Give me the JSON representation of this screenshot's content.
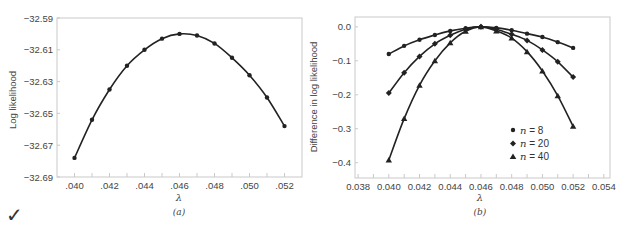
{
  "chart_data": [
    {
      "type": "line",
      "panel_label": "(a)",
      "title": "",
      "xlabel": "λ",
      "ylabel": "Log likelihood",
      "xlim": [
        0.039,
        0.053
      ],
      "ylim": [
        -32.69,
        -32.59
      ],
      "x_ticks": [
        ".040",
        ".042",
        ".044",
        ".046",
        ".048",
        ".050",
        ".052"
      ],
      "y_ticks": [
        "-32.59",
        "-32.61",
        "-32.63",
        "-32.65",
        "-32.67",
        "-32.69"
      ],
      "grid": false,
      "x": [
        0.04,
        0.041,
        0.042,
        0.043,
        0.044,
        0.045,
        0.046,
        0.047,
        0.048,
        0.049,
        0.05,
        0.051,
        0.052
      ],
      "series": [
        {
          "name": "Log likelihood",
          "marker": "circle",
          "values": [
            -32.678,
            -32.654,
            -32.635,
            -32.62,
            -32.61,
            -32.603,
            -32.6,
            -32.601,
            -32.606,
            -32.615,
            -32.626,
            -32.64,
            -32.658
          ]
        }
      ]
    },
    {
      "type": "line",
      "panel_label": "(b)",
      "title": "",
      "xlabel": "λ",
      "ylabel": "Difference in log likelihood",
      "xlim": [
        0.038,
        0.054
      ],
      "ylim": [
        -0.445,
        0.02
      ],
      "x_ticks": [
        "0.038",
        "0.040",
        "0.042",
        "0.044",
        "0.046",
        "0.048",
        "0.050",
        "0.052",
        "0.054"
      ],
      "y_ticks": [
        "0.0",
        "-0.1",
        "-0.2",
        "-0.3",
        "-0.4"
      ],
      "grid": false,
      "legend_position": "lower right",
      "x": [
        0.04,
        0.041,
        0.042,
        0.043,
        0.044,
        0.045,
        0.046,
        0.047,
        0.048,
        0.049,
        0.05,
        0.051,
        0.052
      ],
      "series": [
        {
          "name": "n = 8",
          "marker": "circle",
          "values": [
            -0.08,
            -0.056,
            -0.038,
            -0.024,
            -0.012,
            -0.004,
            0.0,
            -0.003,
            -0.01,
            -0.02,
            -0.03,
            -0.045,
            -0.062
          ]
        },
        {
          "name": "n = 20",
          "marker": "diamond",
          "values": [
            -0.195,
            -0.135,
            -0.087,
            -0.05,
            -0.025,
            -0.007,
            0.0,
            -0.007,
            -0.022,
            -0.04,
            -0.068,
            -0.103,
            -0.148
          ]
        },
        {
          "name": "n = 40",
          "marker": "triangle",
          "values": [
            -0.392,
            -0.27,
            -0.172,
            -0.1,
            -0.047,
            -0.013,
            0.0,
            -0.012,
            -0.033,
            -0.073,
            -0.13,
            -0.203,
            -0.293
          ]
        }
      ]
    }
  ],
  "legend": {
    "items": [
      {
        "n_symbol": "n",
        "rest": " = 8"
      },
      {
        "n_symbol": "n",
        "rest": " = 20"
      },
      {
        "n_symbol": "n",
        "rest": " = 40"
      }
    ]
  },
  "decorations": {
    "checkmark": "✓"
  },
  "colors": {
    "line": "#222222",
    "frame": "#c9c9c9",
    "text": "#444444"
  }
}
